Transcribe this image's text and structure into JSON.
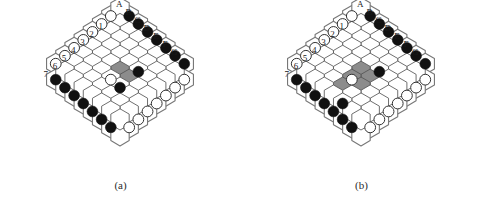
{
  "figure": {
    "type": "hex-board-diagram",
    "panels": [
      {
        "id": "a",
        "caption": "(a)",
        "board_size": 7,
        "column_labels": [
          "A",
          "B",
          "C",
          "D",
          "E",
          "F",
          "G"
        ],
        "row_labels": [
          "1",
          "2",
          "3",
          "4",
          "5",
          "6",
          "7"
        ],
        "colors": {
          "black_stone": "#111111",
          "white_stone": "#ffffff",
          "highlight_hex": "#8c8c8c",
          "cell_outline": "#555555",
          "border_outline": "#777777"
        },
        "border_top_left_stones": "black",
        "border_bottom_right_stones": "black",
        "border_bottom_left_stones": "white",
        "border_top_right_stones": "white",
        "highlighted_cells": [
          "D4",
          "E4"
        ],
        "interior_black_stones": [
          "E3",
          "E5"
        ],
        "interior_white_stones": [
          "D5"
        ]
      },
      {
        "id": "b",
        "caption": "(b)",
        "board_size": 7,
        "column_labels": [
          "A",
          "B",
          "C",
          "D",
          "E",
          "F",
          "G"
        ],
        "row_labels": [
          "1",
          "2",
          "3",
          "4",
          "5",
          "6",
          "7"
        ],
        "colors": {
          "black_stone": "#111111",
          "white_stone": "#ffffff",
          "highlight_hex": "#8c8c8c",
          "cell_outline": "#555555",
          "border_outline": "#777777"
        },
        "border_top_left_stones": "black",
        "border_bottom_right_stones": "black",
        "border_bottom_left_stones": "white",
        "border_top_right_stones": "white",
        "highlighted_cells": [
          "D4",
          "E4",
          "D5",
          "E5",
          "D6"
        ],
        "interior_black_stones": [
          "E3",
          "E7"
        ],
        "interior_white_stones": [
          "D5"
        ]
      }
    ]
  }
}
